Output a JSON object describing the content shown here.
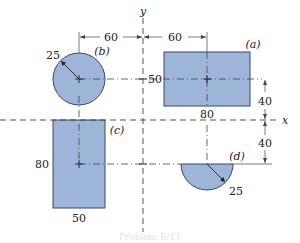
{
  "diagram": {
    "axes": {
      "x_label": "x",
      "y_label": "y"
    },
    "colors": {
      "fill": "#9db5d8",
      "stroke": "#3a4a60",
      "line": "#333333",
      "caption": "#e4e4e4"
    },
    "shapes": {
      "a": {
        "label": "(a)",
        "type": "rectangle",
        "width_label": "80",
        "height_label": "50"
      },
      "b": {
        "label": "(b)",
        "type": "circle",
        "radius_label": "25"
      },
      "c": {
        "label": "(c)",
        "type": "rectangle",
        "width_label": "50",
        "height_label": "80"
      },
      "d": {
        "label": "(d)",
        "type": "semicircle",
        "radius_label": "25"
      }
    },
    "dimensions": {
      "left_offset": "60",
      "right_offset": "60",
      "upper_vertical": "40",
      "lower_vertical": "40"
    },
    "caption": "Problem B/11"
  }
}
